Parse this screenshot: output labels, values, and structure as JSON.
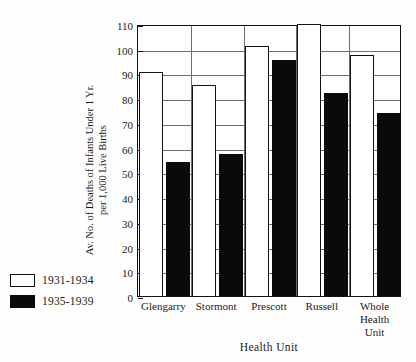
{
  "chart_data": {
    "type": "bar",
    "title": "",
    "xlabel": "Health Unit",
    "ylabel": "Av. No. of Deaths of Infants Under 1 Yr.\nper 1,000 Live Births",
    "categories": [
      "Glengarry",
      "Stormont",
      "Prescott",
      "Russell",
      "Whole\nHealth\nUnit"
    ],
    "ylim": [
      0,
      110
    ],
    "yticks": [
      0,
      10,
      20,
      30,
      40,
      50,
      60,
      70,
      80,
      90,
      100,
      110
    ],
    "grid": true,
    "legend_position": "outside-lower-left",
    "series": [
      {
        "name": "1931-1934",
        "style": "open",
        "values": [
          90.5,
          85.5,
          101,
          110,
          97.5
        ],
        "notes": [
          "",
          "",
          "",
          "clipped at axis maximum",
          ""
        ]
      },
      {
        "name": "1935-1939",
        "style": "filled",
        "values": [
          54,
          57.5,
          95.5,
          82,
          74
        ]
      }
    ]
  },
  "legend": {
    "items": [
      {
        "label": "1931-1934",
        "swatch": "open-square-icon"
      },
      {
        "label": "1935-1939",
        "swatch": "filled-square-icon"
      }
    ]
  }
}
